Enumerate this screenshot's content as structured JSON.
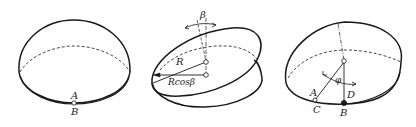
{
  "figure": {
    "panels": [
      {
        "id": "panel-a",
        "description": "Horizontal disk with coincident points A and B at bottom",
        "labels": {
          "A": "A",
          "B": "B"
        }
      },
      {
        "id": "panel-b",
        "description": "Tilted disk by angle beta, showing R and R cos beta",
        "labels": {
          "beta": "β",
          "R": "R",
          "Rcos": "Rcosβ"
        }
      },
      {
        "id": "panel-c",
        "description": "Tilted disk with rotation angle phi; points A, C, D, B",
        "labels": {
          "phi": "φ",
          "A": "A",
          "C": "C",
          "D": "D",
          "B": "B"
        }
      }
    ]
  },
  "colors": {
    "stroke": "#1a1a1a",
    "background": "#ffffff"
  }
}
